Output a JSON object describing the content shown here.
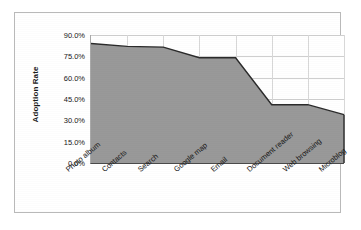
{
  "chart_data": {
    "type": "area",
    "title": "",
    "xlabel": "",
    "ylabel": "Adoption Rate",
    "categories": [
      "Photo album",
      "Contacts",
      "Search",
      "Google map",
      "Email",
      "Document reader",
      "Web browsing",
      "Microblog"
    ],
    "values": [
      84.0,
      82.0,
      81.5,
      74.0,
      74.0,
      41.0,
      41.0,
      34.0
    ],
    "ylim": [
      0,
      90
    ],
    "ytick_values": [
      0,
      15,
      30,
      45,
      60,
      75,
      90
    ],
    "ytick_labels": [
      "0.0%",
      "15.0%",
      "30.0%",
      "45.0%",
      "60.0%",
      "75.0%",
      "90.0%"
    ],
    "grid": true,
    "legend": "none",
    "series_fill_color": "#999999",
    "series_line_color": "#2b2b2b",
    "plot_background": "#ffffff",
    "frame_border_color": "#b9b9b9"
  }
}
